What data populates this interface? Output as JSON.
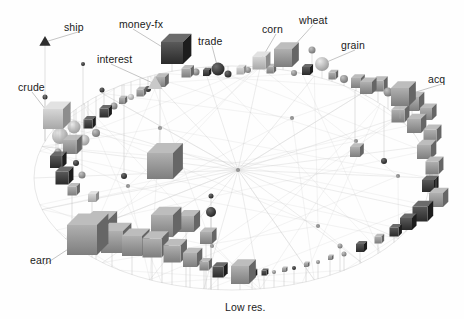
{
  "figure": {
    "title": "",
    "background_color": "#fefefe",
    "label_color": "#1a1a1a",
    "edge_color": "#c9c9c9",
    "node_fill_light": "#b9b9b9",
    "node_fill_mid": "#8f8f8f",
    "node_fill_dark": "#3a3a3a",
    "caption": "Low res."
  },
  "labels": [
    {
      "id": "ship",
      "text": "ship",
      "x": 64,
      "y": 22,
      "anchor_x": 45,
      "anchor_y": 42
    },
    {
      "id": "money-fx",
      "text": "money-fx",
      "x": 119,
      "y": 19,
      "anchor_x": 172,
      "anchor_y": 53
    },
    {
      "id": "trade",
      "text": "trade",
      "x": 198,
      "y": 36,
      "anchor_x": 218,
      "anchor_y": 69
    },
    {
      "id": "corn",
      "text": "corn",
      "x": 262,
      "y": 24,
      "anchor_x": 259,
      "anchor_y": 63
    },
    {
      "id": "wheat",
      "text": "wheat",
      "x": 299,
      "y": 15,
      "anchor_x": 283,
      "anchor_y": 58
    },
    {
      "id": "grain",
      "text": "grain",
      "x": 341,
      "y": 40,
      "anchor_x": 322,
      "anchor_y": 64
    },
    {
      "id": "acq",
      "text": "acq",
      "x": 428,
      "y": 74,
      "anchor_x": 400,
      "anchor_y": 97
    },
    {
      "id": "interest",
      "text": "interest",
      "x": 97,
      "y": 54,
      "anchor_x": 155,
      "anchor_y": 84
    },
    {
      "id": "crude",
      "text": "crude",
      "x": 18,
      "y": 82,
      "anchor_x": 53,
      "anchor_y": 119
    },
    {
      "id": "earn",
      "text": "earn",
      "x": 30,
      "y": 255,
      "anchor_x": 82,
      "anchor_y": 240
    },
    {
      "id": "lowres",
      "text": "Low res.",
      "x": 225,
      "y": 302,
      "anchor_x": null,
      "anchor_y": null
    }
  ],
  "chart_data": {
    "type": "scatter",
    "title": "",
    "xlabel": "",
    "ylabel": "",
    "layout": "elliptical-ring-3d-graph",
    "ellipse": {
      "cx": 232,
      "cy": 178,
      "rx": 198,
      "ry": 112,
      "tilt_deg": -4
    },
    "hub": {
      "x": 238,
      "y": 170
    },
    "legend": "none",
    "grid": false,
    "named_nodes": [
      {
        "name": "ship",
        "x": 45,
        "y": 42,
        "size": 9,
        "shape": "cone",
        "shade": "dark"
      },
      {
        "name": "money-fx",
        "x": 172,
        "y": 53,
        "size": 22,
        "shape": "cube",
        "shade": "dark"
      },
      {
        "name": "trade",
        "x": 218,
        "y": 69,
        "size": 13,
        "shape": "sphere",
        "shade": "dark"
      },
      {
        "name": "corn",
        "x": 259,
        "y": 63,
        "size": 13,
        "shape": "cube",
        "shade": "light"
      },
      {
        "name": "wheat",
        "x": 283,
        "y": 58,
        "size": 18,
        "shape": "cube",
        "shade": "mid"
      },
      {
        "name": "grain",
        "x": 322,
        "y": 64,
        "size": 14,
        "shape": "sphere",
        "shade": "light"
      },
      {
        "name": "acq",
        "x": 400,
        "y": 97,
        "size": 18,
        "shape": "cube",
        "shade": "mid"
      },
      {
        "name": "interest",
        "x": 155,
        "y": 84,
        "size": 12,
        "shape": "cone",
        "shade": "light"
      },
      {
        "name": "crude",
        "x": 53,
        "y": 119,
        "size": 20,
        "shape": "cube",
        "shade": "light"
      },
      {
        "name": "earn",
        "x": 82,
        "y": 240,
        "size": 30,
        "shape": "cube",
        "shade": "mid"
      }
    ],
    "ring_nodes": [
      {
        "x": 60,
        "y": 136,
        "s": 16,
        "sh": "sphere",
        "g": "light"
      },
      {
        "x": 74,
        "y": 127,
        "s": 13,
        "sh": "sphere",
        "g": "light"
      },
      {
        "x": 70,
        "y": 147,
        "s": 14,
        "sh": "cube",
        "g": "mid"
      },
      {
        "x": 84,
        "y": 140,
        "s": 11,
        "sh": "sphere",
        "g": "light"
      },
      {
        "x": 88,
        "y": 124,
        "s": 9,
        "sh": "cube",
        "g": "dark"
      },
      {
        "x": 96,
        "y": 133,
        "s": 8,
        "sh": "sphere",
        "g": "mid"
      },
      {
        "x": 56,
        "y": 162,
        "s": 12,
        "sh": "cube",
        "g": "dark"
      },
      {
        "x": 62,
        "y": 178,
        "s": 13,
        "sh": "cube",
        "g": "dark"
      },
      {
        "x": 72,
        "y": 191,
        "s": 9,
        "sh": "cube",
        "g": "mid"
      },
      {
        "x": 58,
        "y": 152,
        "s": 7,
        "sh": "sphere",
        "g": "mid"
      },
      {
        "x": 82,
        "y": 175,
        "s": 7,
        "sh": "sphere",
        "g": "mid"
      },
      {
        "x": 76,
        "y": 163,
        "s": 6,
        "sh": "sphere",
        "g": "dark"
      },
      {
        "x": 92,
        "y": 198,
        "s": 8,
        "sh": "cube",
        "g": "light"
      },
      {
        "x": 104,
        "y": 113,
        "s": 9,
        "sh": "cube",
        "g": "dark"
      },
      {
        "x": 114,
        "y": 106,
        "s": 7,
        "sh": "sphere",
        "g": "mid"
      },
      {
        "x": 122,
        "y": 101,
        "s": 6,
        "sh": "cube",
        "g": "mid"
      },
      {
        "x": 131,
        "y": 97,
        "s": 6,
        "sh": "sphere",
        "g": "light"
      },
      {
        "x": 140,
        "y": 93,
        "s": 7,
        "sh": "cube",
        "g": "mid"
      },
      {
        "x": 148,
        "y": 89,
        "s": 6,
        "sh": "sphere",
        "g": "dark"
      },
      {
        "x": 160,
        "y": 82,
        "s": 10,
        "sh": "cube",
        "g": "mid"
      },
      {
        "x": 186,
        "y": 73,
        "s": 9,
        "sh": "cube",
        "g": "mid"
      },
      {
        "x": 196,
        "y": 72,
        "s": 7,
        "sh": "sphere",
        "g": "mid"
      },
      {
        "x": 206,
        "y": 73,
        "s": 6,
        "sh": "cube",
        "g": "dark"
      },
      {
        "x": 228,
        "y": 74,
        "s": 7,
        "sh": "sphere",
        "g": "dark"
      },
      {
        "x": 240,
        "y": 71,
        "s": 7,
        "sh": "cube",
        "g": "light"
      },
      {
        "x": 248,
        "y": 70,
        "s": 6,
        "sh": "sphere",
        "g": "mid"
      },
      {
        "x": 270,
        "y": 70,
        "s": 7,
        "sh": "cube",
        "g": "mid"
      },
      {
        "x": 294,
        "y": 73,
        "s": 6,
        "sh": "sphere",
        "g": "mid"
      },
      {
        "x": 306,
        "y": 71,
        "s": 8,
        "sh": "cube",
        "g": "dark"
      },
      {
        "x": 312,
        "y": 50,
        "s": 7,
        "sh": "sphere",
        "g": "mid"
      },
      {
        "x": 332,
        "y": 76,
        "s": 7,
        "sh": "cube",
        "g": "mid"
      },
      {
        "x": 344,
        "y": 79,
        "s": 8,
        "sh": "sphere",
        "g": "mid"
      },
      {
        "x": 356,
        "y": 83,
        "s": 10,
        "sh": "cube",
        "g": "mid"
      },
      {
        "x": 366,
        "y": 88,
        "s": 12,
        "sh": "cube",
        "g": "mid"
      },
      {
        "x": 378,
        "y": 86,
        "s": 11,
        "sh": "cube",
        "g": "mid"
      },
      {
        "x": 388,
        "y": 92,
        "s": 9,
        "sh": "sphere",
        "g": "mid"
      },
      {
        "x": 412,
        "y": 104,
        "s": 14,
        "sh": "cube",
        "g": "mid"
      },
      {
        "x": 398,
        "y": 116,
        "s": 13,
        "sh": "cube",
        "g": "mid"
      },
      {
        "x": 414,
        "y": 126,
        "s": 14,
        "sh": "cube",
        "g": "mid"
      },
      {
        "x": 426,
        "y": 114,
        "s": 12,
        "sh": "cube",
        "g": "mid"
      },
      {
        "x": 430,
        "y": 136,
        "s": 13,
        "sh": "cube",
        "g": "mid"
      },
      {
        "x": 424,
        "y": 152,
        "s": 14,
        "sh": "cube",
        "g": "mid"
      },
      {
        "x": 432,
        "y": 168,
        "s": 13,
        "sh": "cube",
        "g": "mid"
      },
      {
        "x": 428,
        "y": 186,
        "s": 12,
        "sh": "cube",
        "g": "dark"
      },
      {
        "x": 436,
        "y": 200,
        "s": 14,
        "sh": "cube",
        "g": "mid"
      },
      {
        "x": 420,
        "y": 214,
        "s": 15,
        "sh": "cube",
        "g": "dark"
      },
      {
        "x": 406,
        "y": 224,
        "s": 12,
        "sh": "cube",
        "g": "dark"
      },
      {
        "x": 394,
        "y": 232,
        "s": 9,
        "sh": "cube",
        "g": "dark"
      },
      {
        "x": 378,
        "y": 240,
        "s": 7,
        "sh": "cube",
        "g": "mid"
      },
      {
        "x": 360,
        "y": 248,
        "s": 8,
        "sh": "cube",
        "g": "dark"
      },
      {
        "x": 344,
        "y": 254,
        "s": 5,
        "sh": "sphere",
        "g": "mid"
      },
      {
        "x": 330,
        "y": 258,
        "s": 4,
        "sh": "cube",
        "g": "mid"
      },
      {
        "x": 318,
        "y": 262,
        "s": 4,
        "sh": "sphere",
        "g": "mid"
      },
      {
        "x": 306,
        "y": 265,
        "s": 4,
        "sh": "cube",
        "g": "mid"
      },
      {
        "x": 294,
        "y": 268,
        "s": 4,
        "sh": "sphere",
        "g": "dark"
      },
      {
        "x": 284,
        "y": 270,
        "s": 4,
        "sh": "cube",
        "g": "mid"
      },
      {
        "x": 274,
        "y": 272,
        "s": 4,
        "sh": "sphere",
        "g": "mid"
      },
      {
        "x": 264,
        "y": 273,
        "s": 5,
        "sh": "cube",
        "g": "dark"
      },
      {
        "x": 252,
        "y": 274,
        "s": 6,
        "sh": "cube",
        "g": "dark"
      },
      {
        "x": 240,
        "y": 275,
        "s": 18,
        "sh": "cube",
        "g": "mid"
      },
      {
        "x": 218,
        "y": 272,
        "s": 11,
        "sh": "cube",
        "g": "dark"
      },
      {
        "x": 204,
        "y": 266,
        "s": 9,
        "sh": "cube",
        "g": "mid"
      },
      {
        "x": 190,
        "y": 260,
        "s": 14,
        "sh": "cube",
        "g": "mid"
      },
      {
        "x": 172,
        "y": 254,
        "s": 17,
        "sh": "cube",
        "g": "mid"
      },
      {
        "x": 152,
        "y": 248,
        "s": 19,
        "sh": "cube",
        "g": "mid"
      },
      {
        "x": 132,
        "y": 246,
        "s": 20,
        "sh": "cube",
        "g": "mid"
      },
      {
        "x": 112,
        "y": 242,
        "s": 22,
        "sh": "cube",
        "g": "mid"
      },
      {
        "x": 96,
        "y": 232,
        "s": 24,
        "sh": "cube",
        "g": "mid"
      },
      {
        "x": 162,
        "y": 226,
        "s": 22,
        "sh": "cube",
        "g": "mid"
      },
      {
        "x": 186,
        "y": 224,
        "s": 16,
        "sh": "cube",
        "g": "mid"
      },
      {
        "x": 206,
        "y": 238,
        "s": 12,
        "sh": "cube",
        "g": "mid"
      },
      {
        "x": 160,
        "y": 166,
        "s": 26,
        "sh": "cube",
        "g": "mid"
      },
      {
        "x": 211,
        "y": 212,
        "s": 10,
        "sh": "sphere",
        "g": "dark"
      },
      {
        "x": 211,
        "y": 196,
        "s": 5,
        "sh": "sphere",
        "g": "dark"
      },
      {
        "x": 124,
        "y": 176,
        "s": 6,
        "sh": "sphere",
        "g": "dark"
      },
      {
        "x": 355,
        "y": 152,
        "s": 10,
        "sh": "cube",
        "g": "mid"
      },
      {
        "x": 384,
        "y": 161,
        "s": 6,
        "sh": "sphere",
        "g": "dark"
      },
      {
        "x": 340,
        "y": 246,
        "s": 5,
        "sh": "sphere",
        "g": "mid"
      },
      {
        "x": 102,
        "y": 90,
        "s": 5,
        "sh": "sphere",
        "g": "dark"
      },
      {
        "x": 83,
        "y": 64,
        "s": 4,
        "sh": "sphere",
        "g": "dark"
      },
      {
        "x": 45,
        "y": 97,
        "s": 5,
        "sh": "sphere",
        "g": "dark"
      }
    ],
    "edges_description": "faint grey chords and hub spokes across ellipse interior"
  }
}
